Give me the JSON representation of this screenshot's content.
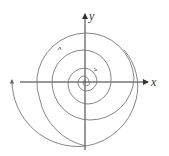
{
  "diagram": {
    "type": "phase-portrait-spiral",
    "axes": {
      "x_label": "x",
      "y_label": "y"
    },
    "curve": {
      "description": "unstable spiral trajectory winding outward counterclockwise from origin",
      "direction": "counterclockwise, outward",
      "color": "#666666"
    },
    "axis_color": "#333333"
  }
}
